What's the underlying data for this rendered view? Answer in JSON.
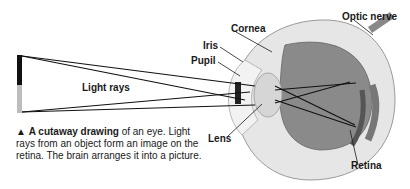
{
  "diagram": {
    "title": "A cutaway drawing of an eye",
    "labels": {
      "cornea": "Cornea",
      "iris": "Iris",
      "pupil": "Pupil",
      "light_rays": "Light rays",
      "lens": "Lens",
      "optic_nerve": "Optic nerve",
      "retina": "Retina"
    },
    "caption": {
      "marker": "▲",
      "bold": "A cutaway drawing",
      "rest": " of an eye. Light rays from an object form an image on the retina. The brain arranges it into a picture."
    },
    "colors": {
      "object_dark": "#111111",
      "object_light": "#bdbdbd",
      "sclera": "#e8e8e8",
      "interior": "#8a8a8a"
    }
  }
}
